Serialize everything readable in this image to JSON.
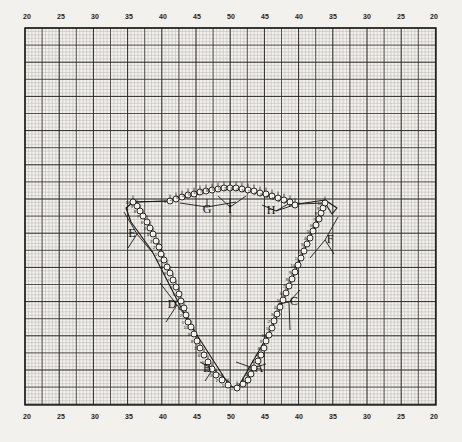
{
  "figure": {
    "kind": "engineering-grid-plot",
    "background_color": "#f3f1ee",
    "ink_color": "#1a1816",
    "grid": {
      "minor_color": "#b9b4ad",
      "major_color": "#2c2a27",
      "border_color": "#1a1816",
      "minor_step_px": 3.42,
      "major_every": 5,
      "plot_left_px": 25,
      "plot_top_px": 28,
      "plot_right_px": 436,
      "plot_bottom_px": 405,
      "minor_visible": true,
      "major_visible": true
    }
  },
  "axes": {
    "top_labels": [
      "20",
      "25",
      "30",
      "35",
      "40",
      "45",
      "50",
      "45",
      "40",
      "35",
      "30",
      "25",
      "20"
    ],
    "bottom_labels": [
      "20",
      "25",
      "30",
      "35",
      "40",
      "45",
      "50",
      "45",
      "40",
      "35",
      "30",
      "25",
      "20"
    ],
    "label_positions_px": [
      27,
      61,
      95,
      129,
      163,
      197,
      231,
      265,
      299,
      333,
      367,
      401,
      434
    ],
    "top_label_y_px": 19,
    "bottom_label_y_px": 419
  },
  "chart_data": {
    "type": "scatter",
    "title": "",
    "xlabel": "",
    "ylabel": "",
    "xlim": [
      20,
      50,
      20
    ],
    "grid": true,
    "legend": "none",
    "segment_letters": [
      "A",
      "B",
      "C",
      "D",
      "E",
      "F",
      "G",
      "H",
      "I"
    ],
    "series": [
      {
        "name": "A",
        "letter_label": "A",
        "letter_px": [
          259,
          372
        ],
        "leader": [
          [
            253,
            368
          ],
          [
            236,
            362
          ],
          [
            247,
            384
          ],
          [
            266,
            364
          ]
        ],
        "points": [
          {
            "n": "1",
            "x": 237,
            "y": 388
          },
          {
            "n": "2",
            "x": 243,
            "y": 384
          },
          {
            "n": "3",
            "x": 248,
            "y": 380
          },
          {
            "n": "4",
            "x": 251,
            "y": 374
          },
          {
            "n": "5",
            "x": 254,
            "y": 368
          },
          {
            "n": "6",
            "x": 258,
            "y": 361
          },
          {
            "n": "7",
            "x": 261,
            "y": 355
          },
          {
            "n": "8",
            "x": 264,
            "y": 348
          },
          {
            "n": "9",
            "x": 266,
            "y": 341
          },
          {
            "n": "10",
            "x": 269,
            "y": 335
          }
        ]
      },
      {
        "name": "B",
        "letter_label": "B",
        "letter_px": [
          207,
          372
        ],
        "leader": [
          [
            213,
            369
          ],
          [
            229,
            382
          ],
          [
            205,
            381
          ],
          [
            200,
            362
          ]
        ],
        "points": [
          {
            "n": "1",
            "x": 228,
            "y": 385
          },
          {
            "n": "2",
            "x": 222,
            "y": 380
          },
          {
            "n": "3",
            "x": 216,
            "y": 375
          },
          {
            "n": "4",
            "x": 212,
            "y": 369
          },
          {
            "n": "5",
            "x": 208,
            "y": 362
          },
          {
            "n": "6",
            "x": 204,
            "y": 355
          },
          {
            "n": "7",
            "x": 200,
            "y": 348
          },
          {
            "n": "8",
            "x": 197,
            "y": 341
          },
          {
            "n": "9",
            "x": 194,
            "y": 334
          },
          {
            "n": "10",
            "x": 191,
            "y": 327
          }
        ]
      },
      {
        "name": "C",
        "letter_label": "C",
        "letter_px": [
          294,
          305
        ],
        "leader": [
          [
            289,
            302
          ],
          [
            278,
            304
          ],
          [
            290,
            330
          ],
          [
            300,
            290
          ]
        ],
        "points": [
          {
            "n": "1",
            "x": 272,
            "y": 328
          },
          {
            "n": "2",
            "x": 274,
            "y": 321
          },
          {
            "n": "3",
            "x": 277,
            "y": 314
          },
          {
            "n": "4",
            "x": 280,
            "y": 307
          },
          {
            "n": "5",
            "x": 283,
            "y": 300
          },
          {
            "n": "6",
            "x": 286,
            "y": 293
          },
          {
            "n": "7",
            "x": 289,
            "y": 286
          },
          {
            "n": "8",
            "x": 292,
            "y": 279
          },
          {
            "n": "9",
            "x": 295,
            "y": 272
          },
          {
            "n": "10",
            "x": 298,
            "y": 265
          }
        ]
      },
      {
        "name": "D",
        "letter_label": "D",
        "letter_px": [
          172,
          308
        ],
        "leader": [
          [
            177,
            305
          ],
          [
            190,
            322
          ],
          [
            166,
            322
          ],
          [
            160,
            283
          ]
        ],
        "points": [
          {
            "n": "1",
            "x": 188,
            "y": 322
          },
          {
            "n": "2",
            "x": 186,
            "y": 315
          },
          {
            "n": "3",
            "x": 184,
            "y": 308
          },
          {
            "n": "4",
            "x": 181,
            "y": 301
          },
          {
            "n": "5",
            "x": 179,
            "y": 294
          },
          {
            "n": "6",
            "x": 176,
            "y": 287
          },
          {
            "n": "7",
            "x": 173,
            "y": 280
          },
          {
            "n": "8",
            "x": 170,
            "y": 273
          },
          {
            "n": "9",
            "x": 167,
            "y": 267
          },
          {
            "n": "10",
            "x": 164,
            "y": 260
          }
        ]
      },
      {
        "name": "E",
        "letter_label": "E",
        "letter_px": [
          132,
          237
        ],
        "leader": [
          [
            137,
            234
          ],
          [
            152,
            252
          ],
          [
            128,
            248
          ],
          [
            124,
            212
          ]
        ],
        "points": [
          {
            "n": "1",
            "x": 161,
            "y": 254
          },
          {
            "n": "2",
            "x": 159,
            "y": 247
          },
          {
            "n": "3",
            "x": 156,
            "y": 241
          },
          {
            "n": "4",
            "x": 153,
            "y": 234
          },
          {
            "n": "5",
            "x": 150,
            "y": 228
          },
          {
            "n": "6",
            "x": 147,
            "y": 222
          },
          {
            "n": "7",
            "x": 143,
            "y": 216
          },
          {
            "n": "8",
            "x": 140,
            "y": 211
          },
          {
            "n": "9",
            "x": 137,
            "y": 206
          },
          {
            "n": "10",
            "x": 133,
            "y": 202
          }
        ]
      },
      {
        "name": "F",
        "letter_label": "F",
        "letter_px": [
          330,
          243
        ],
        "leader": [
          [
            325,
            240
          ],
          [
            310,
            258
          ],
          [
            334,
            254
          ],
          [
            338,
            217
          ]
        ],
        "points": [
          {
            "n": "1",
            "x": 301,
            "y": 258
          },
          {
            "n": "2",
            "x": 304,
            "y": 251
          },
          {
            "n": "3",
            "x": 307,
            "y": 244
          },
          {
            "n": "4",
            "x": 310,
            "y": 238
          },
          {
            "n": "5",
            "x": 313,
            "y": 231
          },
          {
            "n": "6",
            "x": 316,
            "y": 225
          },
          {
            "n": "7",
            "x": 319,
            "y": 219
          },
          {
            "n": "8",
            "x": 321,
            "y": 213
          },
          {
            "n": "9",
            "x": 323,
            "y": 208
          },
          {
            "n": "10",
            "x": 325,
            "y": 203
          }
        ]
      },
      {
        "name": "G",
        "letter_label": "G",
        "letter_px": [
          207,
          213
        ],
        "leader": [
          [
            207,
            207
          ],
          [
            207,
            199
          ],
          [
            180,
            203
          ],
          [
            236,
            202
          ]
        ],
        "points": [
          {
            "n": "1",
            "x": 170,
            "y": 201
          },
          {
            "n": "2",
            "x": 176,
            "y": 199
          },
          {
            "n": "3",
            "x": 182,
            "y": 197
          },
          {
            "n": "4",
            "x": 188,
            "y": 195
          },
          {
            "n": "5",
            "x": 194,
            "y": 194
          },
          {
            "n": "6",
            "x": 200,
            "y": 192
          },
          {
            "n": "7",
            "x": 206,
            "y": 191
          },
          {
            "n": "8",
            "x": 212,
            "y": 190
          },
          {
            "n": "9",
            "x": 218,
            "y": 189
          }
        ]
      },
      {
        "name": "I",
        "letter_label": "I",
        "letter_px": [
          230,
          213
        ],
        "leader": [
          [
            230,
            207
          ],
          [
            230,
            198
          ],
          [
            218,
            196
          ],
          [
            246,
            196
          ]
        ],
        "points": [
          {
            "n": "1",
            "x": 224,
            "y": 188
          },
          {
            "n": "2",
            "x": 230,
            "y": 188
          },
          {
            "n": "3",
            "x": 236,
            "y": 188
          },
          {
            "n": "4",
            "x": 242,
            "y": 189
          },
          {
            "n": "5",
            "x": 248,
            "y": 190
          }
        ]
      },
      {
        "name": "H",
        "letter_label": "H",
        "letter_px": [
          271,
          214
        ],
        "leader": [
          [
            276,
            211
          ],
          [
            288,
            204
          ],
          [
            262,
            205
          ],
          [
            300,
            203
          ]
        ],
        "points": [
          {
            "n": "1",
            "x": 254,
            "y": 191
          },
          {
            "n": "2",
            "x": 260,
            "y": 193
          },
          {
            "n": "3",
            "x": 266,
            "y": 194
          },
          {
            "n": "4",
            "x": 272,
            "y": 196
          },
          {
            "n": "5",
            "x": 278,
            "y": 198
          },
          {
            "n": "6",
            "x": 284,
            "y": 200
          },
          {
            "n": "7",
            "x": 290,
            "y": 202
          },
          {
            "n": "8",
            "x": 295,
            "y": 205
          }
        ]
      }
    ],
    "outline_polyline": [
      [
        133,
        202
      ],
      [
        126,
        208
      ],
      [
        131,
        222
      ],
      [
        152,
        251
      ],
      [
        188,
        321
      ],
      [
        229,
        385
      ],
      [
        237,
        389
      ],
      [
        272,
        328
      ],
      [
        301,
        258
      ],
      [
        325,
        203
      ],
      [
        332,
        214
      ],
      [
        337,
        208
      ],
      [
        325,
        200
      ],
      [
        298,
        204
      ],
      [
        248,
        190
      ],
      [
        224,
        188
      ],
      [
        170,
        201
      ],
      [
        133,
        202
      ]
    ],
    "inner_chain": [
      [
        133,
        202
      ],
      [
        170,
        201
      ],
      [
        194,
        194
      ],
      [
        224,
        188
      ],
      [
        248,
        190
      ],
      [
        272,
        196
      ],
      [
        298,
        204
      ],
      [
        325,
        203
      ]
    ],
    "center_tick_px": [
      231,
      216
    ]
  }
}
